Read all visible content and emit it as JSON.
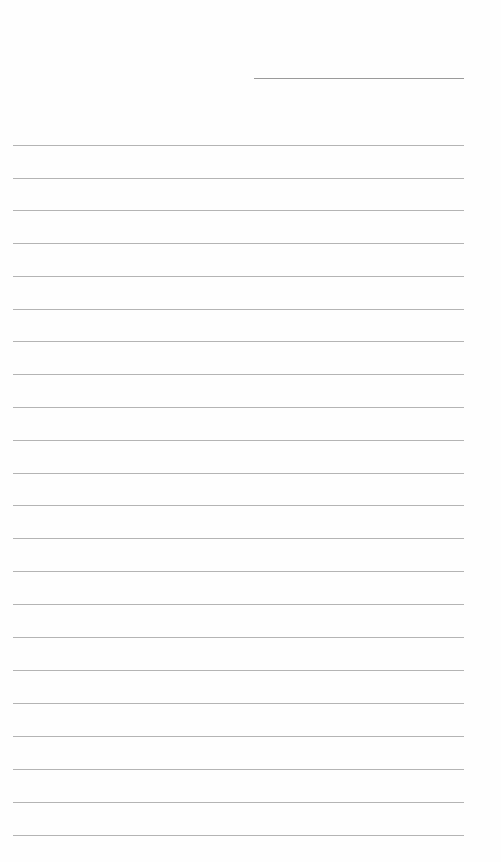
{
  "document": {
    "type": "lined-paper",
    "header_field": {
      "label": "",
      "value": "",
      "line": {
        "x": 254,
        "y": 78,
        "width": 210
      }
    },
    "ruled_lines": {
      "count": 22,
      "left": 13,
      "width": 451,
      "positions_y": [
        145,
        178,
        210,
        243,
        276,
        309,
        341,
        374,
        407,
        440,
        473,
        505,
        538,
        571,
        604,
        637,
        670,
        703,
        736,
        769,
        802,
        835
      ],
      "color": "#b4b4b4"
    },
    "body_text": [],
    "background_color": "#fefefe"
  }
}
